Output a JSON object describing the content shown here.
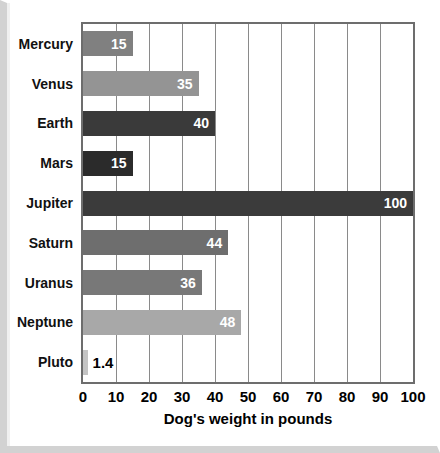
{
  "chart_data": {
    "type": "bar",
    "orientation": "horizontal",
    "title": "",
    "xlabel": "Dog's weight in pounds",
    "ylabel": "",
    "xlim": [
      0,
      100
    ],
    "grid": true,
    "legend": "none",
    "xticks": [
      0,
      10,
      20,
      30,
      40,
      50,
      60,
      70,
      80,
      90,
      100
    ],
    "categories": [
      "Mercury",
      "Venus",
      "Earth",
      "Mars",
      "Jupiter",
      "Saturn",
      "Uranus",
      "Neptune",
      "Pluto"
    ],
    "values": [
      15,
      35,
      40,
      15,
      100,
      44,
      36,
      48,
      1.4
    ],
    "value_labels": [
      "15",
      "35",
      "40",
      "15",
      "100",
      "44",
      "36",
      "48",
      "1.4"
    ],
    "bars": [
      {
        "category": "Mercury",
        "value": 15,
        "label": "15",
        "color": "#808080",
        "label_inside": true
      },
      {
        "category": "Venus",
        "value": 35,
        "label": "35",
        "color": "#949494",
        "label_inside": true
      },
      {
        "category": "Earth",
        "value": 40,
        "label": "40",
        "color": "#3a3a3a",
        "label_inside": true
      },
      {
        "category": "Mars",
        "value": 15,
        "label": "15",
        "color": "#2b2b2b",
        "label_inside": true
      },
      {
        "category": "Jupiter",
        "value": 100,
        "label": "100",
        "color": "#3b3b3b",
        "label_inside": true
      },
      {
        "category": "Saturn",
        "value": 44,
        "label": "44",
        "color": "#6e6e6e",
        "label_inside": true
      },
      {
        "category": "Uranus",
        "value": 36,
        "label": "36",
        "color": "#787878",
        "label_inside": true
      },
      {
        "category": "Neptune",
        "value": 48,
        "label": "48",
        "color": "#a8a8a8",
        "label_inside": true
      },
      {
        "category": "Pluto",
        "value": 1.4,
        "label": "1.4",
        "color": "#c4c4c4",
        "label_inside": false
      }
    ]
  },
  "colors": {
    "axis": "#6d6d6d",
    "gridline": "#8a8a8a",
    "background": "#ffffff",
    "text": "#111111",
    "frame": "#d2d2d2"
  }
}
